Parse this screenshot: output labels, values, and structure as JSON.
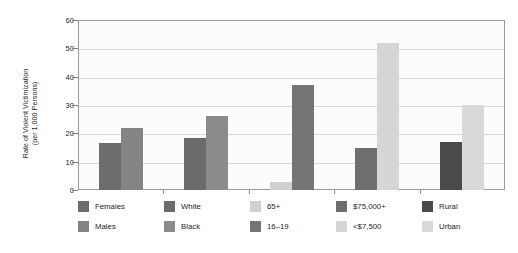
{
  "chart_data": {
    "type": "bar",
    "title": "",
    "subtitle": "",
    "xlabel": "",
    "ylabel": "Rate of Violent Victimization (per 1,000 Persons)",
    "ylabel_lines": [
      "Rate of Violent Victimization",
      "(per 1,000 Persons)"
    ],
    "ylim": [
      0,
      60
    ],
    "ytick_labels": [
      "0",
      "10",
      "20",
      "30",
      "40",
      "50",
      "60"
    ],
    "ytick_values": [
      0,
      10,
      20,
      30,
      40,
      50,
      60
    ],
    "grid": "horizontal",
    "legend_position": "below-plot",
    "categories": [
      "Sex",
      "Race",
      "Age",
      "Income",
      "Location"
    ],
    "bars": [
      {
        "label": "Females",
        "value": 16.5,
        "color": "#6d6d6d",
        "group": "Sex"
      },
      {
        "label": "Males",
        "value": 22.0,
        "color": "#848484",
        "group": "Sex"
      },
      {
        "label": "White",
        "value": 18.3,
        "color": "#6b6b6b",
        "group": "Race"
      },
      {
        "label": "Black",
        "value": 26.0,
        "color": "#8b8b8b",
        "group": "Race"
      },
      {
        "label": "65+",
        "value": 3.0,
        "color": "#d0d0d0",
        "group": "Age"
      },
      {
        "label": "16–19",
        "value": 37.0,
        "color": "#757575",
        "group": "Age"
      },
      {
        "label": "$75,000+",
        "value": 15.0,
        "color": "#6f6f6f",
        "group": "Income"
      },
      {
        "label": "<$7,500",
        "value": 52.0,
        "color": "#d6d6d6",
        "group": "Income"
      },
      {
        "label": "Rural",
        "value": 17.0,
        "color": "#4a4a4a",
        "group": "Location"
      },
      {
        "label": "Urban",
        "value": 30.0,
        "color": "#d9d9d9",
        "group": "Location"
      }
    ],
    "legend": [
      {
        "label": "Females",
        "color": "#6d6d6d"
      },
      {
        "label": "Males",
        "color": "#848484"
      },
      {
        "label": "White",
        "color": "#6b6b6b"
      },
      {
        "label": "Black",
        "color": "#8b8b8b"
      },
      {
        "label": "65+",
        "color": "#d0d0d0"
      },
      {
        "label": "16–19",
        "color": "#757575"
      },
      {
        "label": "$75,000+",
        "color": "#6f6f6f"
      },
      {
        "label": "<$7,500",
        "color": "#d6d6d6"
      },
      {
        "label": "Rural",
        "color": "#4a4a4a"
      },
      {
        "label": "Urban",
        "color": "#d9d9d9"
      }
    ],
    "colors": {
      "plot_background": "#fcfcfc",
      "page_background": "#ffffff",
      "gridline": "#d8d8d8",
      "axis": "#9a9a9a",
      "text": "#231f20"
    }
  }
}
